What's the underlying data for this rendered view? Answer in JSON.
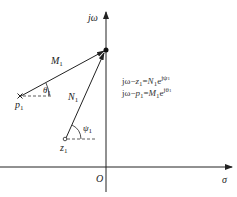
{
  "diagram": {
    "type": "s-plane vector diagram",
    "axes": {
      "vertical_label": "jω",
      "horizontal_label": "σ",
      "origin_label": "O"
    },
    "points": {
      "pole": {
        "symbol": "×",
        "label": "p",
        "sub": "1"
      },
      "zero": {
        "symbol": "o",
        "label": "z",
        "sub": "1"
      },
      "test_point": {
        "symbol": "●",
        "label": "jω"
      }
    },
    "vectors": {
      "from_pole": {
        "label": "M",
        "sub": "1",
        "angle_label": "θ",
        "angle_sub": "1"
      },
      "from_zero": {
        "label": "N",
        "sub": "1",
        "angle_label": "ψ",
        "angle_sub": "1"
      }
    },
    "equations": [
      {
        "lhs_a": "jω",
        "lhs_b": "z",
        "lhs_b_sub": "1",
        "rhs_mag": "N",
        "rhs_mag_sub": "1",
        "rhs_exp": "jψ",
        "rhs_exp_sub": "1"
      },
      {
        "lhs_a": "jω",
        "lhs_b": "p",
        "lhs_b_sub": "1",
        "rhs_mag": "M",
        "rhs_mag_sub": "1",
        "rhs_exp": "jθ",
        "rhs_exp_sub": "1"
      }
    ],
    "colors": {
      "line": "#222222",
      "dashed": "#333333",
      "background": "#ffffff"
    }
  }
}
